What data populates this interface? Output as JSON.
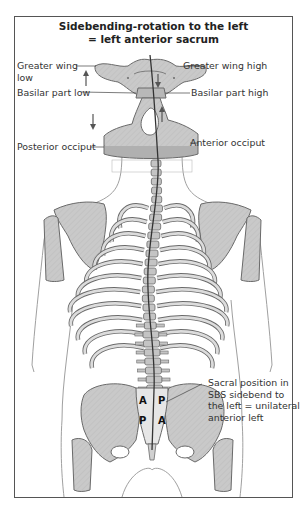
{
  "figure": {
    "title_line1": "Sidebending-rotation to the left",
    "title_line2": "= left anterior sacrum",
    "labels": {
      "greater_wing_low_1": "Greater wing",
      "greater_wing_low_2": "low",
      "greater_wing_high": "Greater wing high",
      "basilar_part_low": "Basilar part low",
      "basilar_part_high": "Basilar part high",
      "posterior_occiput": "Posterior occiput",
      "anterior_occiput": "Anterior occiput",
      "sacral_position_1": "Sacral position in",
      "sacral_position_2": "SBS sidebend to",
      "sacral_position_3": "the left = unilateral",
      "sacral_position_4": "anterior left"
    },
    "sacrum_markers": {
      "upper_left": "A",
      "upper_right": "P",
      "lower_left": "P",
      "lower_right": "A"
    },
    "arrows": {
      "greater_wing_left": "up",
      "greater_wing_right": "down",
      "occiput_left": "down",
      "occiput_right": "up"
    },
    "colors": {
      "bone_fill": "#c8c8c8",
      "bone_outline": "#6a6a6a",
      "body_outline": "#9a9a9a",
      "spine_line": "#333333",
      "frame": "#555555"
    }
  }
}
